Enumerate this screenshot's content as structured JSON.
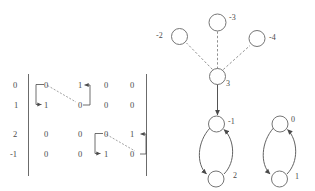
{
  "figure": {
    "background": "#ffffff",
    "ink": "#4a4a4a"
  },
  "matrix": {
    "delimiter": "vertical-bar",
    "row_labels": [
      "0",
      "1",
      "2",
      "-1"
    ],
    "rows": [
      [
        "0",
        "1",
        "0",
        "0"
      ],
      [
        "1",
        "0",
        "0",
        "0"
      ],
      [
        "0",
        "0",
        "0",
        "1"
      ],
      [
        "0",
        "0",
        "1",
        "0"
      ]
    ],
    "annotations": {
      "block1": {
        "label": "block-swap-top-left",
        "dashed_diagonal": true
      },
      "block2": {
        "label": "block-swap-bottom-right",
        "dashed_diagonal": true
      }
    }
  },
  "graph": {
    "star": {
      "center": {
        "label": "3"
      },
      "leaves": [
        {
          "label": "-2",
          "label_side": "left"
        },
        {
          "label": "-3",
          "label_side": "right"
        },
        {
          "label": "-4",
          "label_side": "right"
        }
      ],
      "edge_style": "dashed",
      "outgoing_edge_style": "solid-arrow"
    },
    "cycles": [
      {
        "name": "cycle-left",
        "top": {
          "label": "-1"
        },
        "bottom": {
          "label": "2"
        }
      },
      {
        "name": "cycle-right",
        "top": {
          "label": "0"
        },
        "bottom": {
          "label": "1"
        }
      }
    ]
  }
}
